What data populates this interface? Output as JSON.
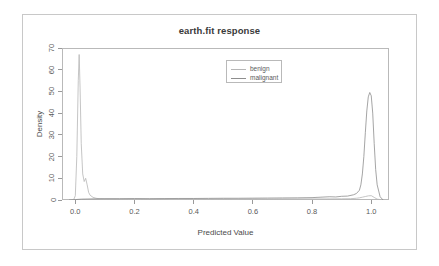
{
  "chart_data": {
    "type": "line",
    "title": "earth.fit response",
    "xlabel": "Predicted Value",
    "ylabel": "Density",
    "xlim": [
      -0.045,
      1.06
    ],
    "ylim": [
      0,
      70
    ],
    "grid": false,
    "legend_position": "top-center",
    "xticks": [
      "0.0",
      "0.2",
      "0.4",
      "0.6",
      "0.8",
      "1.0"
    ],
    "xtick_values": [
      0.0,
      0.2,
      0.4,
      0.6,
      0.8,
      1.0
    ],
    "yticks": [
      "0",
      "10",
      "20",
      "30",
      "40",
      "50",
      "60",
      "70"
    ],
    "ytick_values": [
      0,
      10,
      20,
      30,
      40,
      50,
      60,
      70
    ],
    "series": [
      {
        "name": "benign",
        "color": "#b6b6b6",
        "x": [
          -0.02,
          -0.005,
          0.0,
          0.005,
          0.01,
          0.013,
          0.016,
          0.02,
          0.025,
          0.03,
          0.035,
          0.04,
          0.045,
          0.05,
          0.06,
          0.07,
          0.08,
          0.1,
          0.15,
          0.2,
          0.25,
          0.3,
          0.35,
          0.4,
          0.45,
          0.5,
          0.55,
          0.6,
          0.65,
          0.7,
          0.75,
          0.8,
          0.85,
          0.9,
          0.93,
          0.95,
          0.96,
          0.97,
          0.98,
          0.99,
          1.0,
          1.01,
          1.02,
          1.04
        ],
        "y": [
          0.0,
          0.3,
          2.0,
          20.0,
          55.0,
          67.0,
          52.0,
          26.0,
          12.0,
          8.5,
          10.0,
          7.0,
          3.5,
          2.2,
          1.2,
          0.8,
          0.6,
          0.5,
          0.45,
          0.5,
          0.45,
          0.5,
          0.45,
          0.5,
          0.45,
          0.5,
          0.45,
          0.5,
          0.45,
          0.5,
          0.5,
          0.5,
          0.5,
          0.55,
          0.6,
          0.8,
          1.0,
          1.3,
          1.6,
          1.9,
          2.0,
          1.2,
          0.4,
          0.0
        ]
      },
      {
        "name": "malignant",
        "color": "#8e8e8e",
        "x": [
          -0.02,
          0.0,
          0.02,
          0.05,
          0.1,
          0.15,
          0.2,
          0.25,
          0.3,
          0.35,
          0.4,
          0.45,
          0.5,
          0.55,
          0.6,
          0.65,
          0.7,
          0.75,
          0.8,
          0.83,
          0.86,
          0.88,
          0.9,
          0.92,
          0.94,
          0.95,
          0.96,
          0.965,
          0.97,
          0.975,
          0.98,
          0.985,
          0.99,
          0.995,
          1.0,
          1.005,
          1.01,
          1.015,
          1.02,
          1.03,
          1.04
        ],
        "y": [
          0.0,
          0.2,
          0.4,
          0.5,
          0.6,
          0.6,
          0.65,
          0.6,
          0.65,
          0.7,
          0.7,
          0.75,
          0.8,
          0.8,
          0.85,
          0.9,
          0.95,
          1.0,
          1.1,
          1.3,
          1.5,
          1.4,
          1.7,
          1.8,
          2.4,
          3.0,
          4.5,
          7.0,
          12.0,
          20.0,
          31.0,
          41.0,
          47.5,
          49.5,
          48.0,
          40.0,
          26.0,
          14.0,
          7.0,
          1.5,
          0.0
        ]
      }
    ]
  },
  "legend": {
    "entries": [
      {
        "label": "benign",
        "color": "#b6b6b6"
      },
      {
        "label": "malignant",
        "color": "#8e8e8e"
      }
    ]
  },
  "colors": {
    "frame": "#c8c8c8",
    "axis": "#b9b9b9",
    "tick": "#9a9a9a",
    "text": "#5a5a5a",
    "title": "#3a3a3a",
    "background": "#ffffff"
  }
}
